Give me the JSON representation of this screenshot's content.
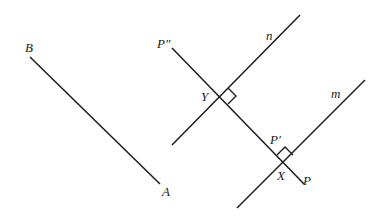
{
  "diagram": {
    "type": "geometry-reflection",
    "stroke_color": "#1a1a1a",
    "background": "#ffffff",
    "labels": {
      "A": "A",
      "B": "B",
      "P": "P",
      "P_prime": "P′",
      "P_double_prime": "P″",
      "X": "X",
      "Y": "Y",
      "m": "m",
      "n": "n"
    },
    "segments": [
      {
        "name": "segment-ab",
        "from": [
          30,
          57
        ],
        "to": [
          160,
          184
        ]
      },
      {
        "name": "line-n",
        "from": [
          300,
          15
        ],
        "to": [
          172,
          145
        ]
      },
      {
        "name": "line-m",
        "from": [
          365,
          80
        ],
        "to": [
          237,
          208
        ]
      },
      {
        "name": "perpendicular-p-p-double-prime",
        "from": [
          172,
          48
        ],
        "to": [
          304,
          184
        ]
      }
    ],
    "right_angle_markers": [
      {
        "at": "Y",
        "point": [
          221,
          95
        ]
      },
      {
        "at": "X",
        "point": [
          285,
          162
        ]
      }
    ]
  }
}
